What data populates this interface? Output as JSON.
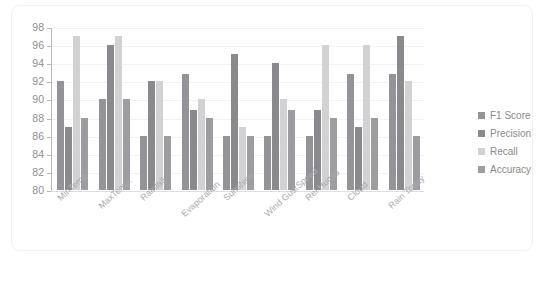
{
  "chart_data": {
    "type": "bar",
    "title": "",
    "xlabel": "",
    "ylabel": "",
    "ylim": [
      80,
      98
    ],
    "ytick_step": 2,
    "ytick_labels": [
      "98",
      "96",
      "94",
      "92",
      "90",
      "88",
      "86",
      "84",
      "82",
      "80"
    ],
    "grid": true,
    "legend_position": "right",
    "categories": [
      "MinTemp",
      "MaxTemp.",
      "Rainfall",
      "Evaporation",
      "Sunshine",
      "Wind GustSpeed",
      "Rel Humid",
      "Cloud",
      "Rain Today"
    ],
    "series": [
      {
        "name": "F1 Score",
        "color": "#949498",
        "values": [
          92,
          90,
          86,
          92.8,
          86,
          86,
          86,
          92.8,
          92.8
        ]
      },
      {
        "name": "Precision",
        "color": "#8a8a8e",
        "values": [
          87,
          96,
          92,
          88.8,
          95,
          94,
          88.8,
          87,
          97
        ]
      },
      {
        "name": "Recall",
        "color": "#d2d2d4",
        "values": [
          97,
          97,
          92,
          90,
          87,
          90,
          96,
          96,
          92
        ]
      },
      {
        "name": "Accuracy",
        "color": "#9d9da1",
        "values": [
          88,
          90,
          86,
          88,
          86,
          88.8,
          88,
          88,
          86
        ]
      }
    ]
  },
  "legend": {
    "items": [
      {
        "label": "F1 Score"
      },
      {
        "label": "Precision"
      },
      {
        "label": "Recall"
      },
      {
        "label": "Accuracy"
      }
    ]
  }
}
